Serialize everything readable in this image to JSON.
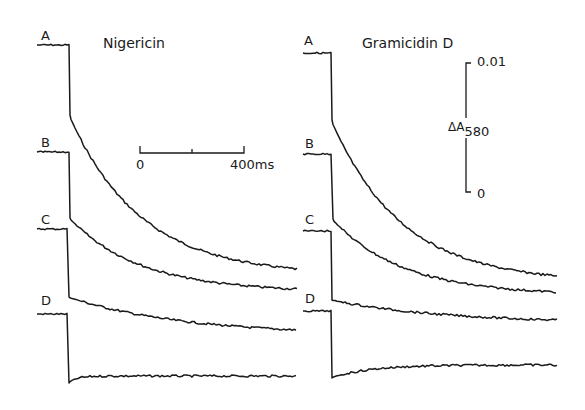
{
  "chart_data": {
    "type": "line",
    "title": "",
    "panels": [
      {
        "name": "Nigericin",
        "traces": [
          {
            "label": "A",
            "baseline_y_px": 45,
            "step_x_px": 69,
            "post_step_y_px": 115,
            "end_y_px": 269,
            "shape": "exponential-decay"
          },
          {
            "label": "B",
            "baseline_y_px": 152,
            "step_x_px": 69,
            "post_step_y_px": 218,
            "end_y_px": 289,
            "shape": "exponential-decay"
          },
          {
            "label": "C",
            "baseline_y_px": 229,
            "step_x_px": 68,
            "post_step_y_px": 297,
            "end_y_px": 330,
            "shape": "slow-decay"
          },
          {
            "label": "D",
            "baseline_y_px": 314,
            "step_x_px": 68,
            "post_step_y_px": 383,
            "end_y_px": 376,
            "shape": "undershoot-flat"
          }
        ]
      },
      {
        "name": "Gramicidin D",
        "traces": [
          {
            "label": "A",
            "baseline_y_px": 53,
            "step_x_px": 331,
            "post_step_y_px": 120,
            "end_y_px": 276,
            "shape": "exponential-decay"
          },
          {
            "label": "B",
            "baseline_y_px": 154,
            "step_x_px": 332,
            "post_step_y_px": 219,
            "end_y_px": 292,
            "shape": "exponential-decay"
          },
          {
            "label": "C",
            "baseline_y_px": 231,
            "step_x_px": 331,
            "post_step_y_px": 300,
            "end_y_px": 320,
            "shape": "slow-decay"
          },
          {
            "label": "D",
            "baseline_y_px": 311,
            "step_x_px": 331,
            "post_step_y_px": 378,
            "end_y_px": 365,
            "shape": "undershoot-recovery"
          }
        ]
      }
    ],
    "time_scale_bar": {
      "start_label": "0",
      "end_label": "400ms",
      "duration_ms": 400
    },
    "absorbance_scale_bar": {
      "label": "ΔA",
      "subscript": "580",
      "top_label": "0.01",
      "bottom_label": "0",
      "range": [
        0,
        0.01
      ]
    },
    "xlabel": "time (ms)",
    "ylabel": "ΔA580",
    "grid": false,
    "legend": "none"
  },
  "labels": {
    "panel_left_title": "Nigericin",
    "panel_right_title": "Gramicidin D",
    "trace_a": "A",
    "trace_b": "B",
    "trace_c": "C",
    "trace_d": "D",
    "time_zero": "0",
    "time_end": "400ms",
    "abs_top": "0.01",
    "abs_bottom": "0",
    "abs_symbol": "ΔA",
    "abs_sub": "580"
  }
}
